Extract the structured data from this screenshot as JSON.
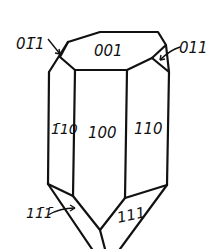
{
  "diagram": {
    "type": "crystal-habit-drawing",
    "colors": {
      "stroke": "#111111",
      "background": "#ffffff"
    },
    "faces": [
      {
        "id": "top",
        "label": "001"
      },
      {
        "id": "upper-left-small",
        "label": "01̄1"
      },
      {
        "id": "upper-right-small",
        "label": "011"
      },
      {
        "id": "prism-left",
        "label": "1̄10"
      },
      {
        "id": "prism-front",
        "label": "100"
      },
      {
        "id": "prism-right",
        "label": "110"
      },
      {
        "id": "pyramid-left",
        "label": "11̄1̄"
      },
      {
        "id": "pyramid-right",
        "label": "111"
      }
    ]
  }
}
